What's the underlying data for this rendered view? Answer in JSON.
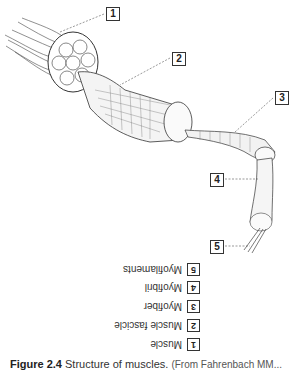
{
  "diagram": {
    "labels": [
      {
        "num": "1",
        "x": 106,
        "y": 7
      },
      {
        "num": "2",
        "x": 172,
        "y": 52
      },
      {
        "num": "3",
        "x": 275,
        "y": 91
      },
      {
        "num": "4",
        "x": 210,
        "y": 173
      },
      {
        "num": "5",
        "x": 210,
        "y": 240
      }
    ]
  },
  "legend": {
    "orientation": "rotated-180",
    "items": [
      {
        "num": "1",
        "text": "Muscle"
      },
      {
        "num": "2",
        "text": "Muscle fascicle"
      },
      {
        "num": "3",
        "text": "Myofiber"
      },
      {
        "num": "4",
        "text": "Myofibril"
      },
      {
        "num": "5",
        "text": "Myofilaments"
      }
    ]
  },
  "caption": {
    "figure": "Figure 2.4",
    "title": "Structure of muscles.",
    "source": "(From Fahrenbach MM..."
  }
}
